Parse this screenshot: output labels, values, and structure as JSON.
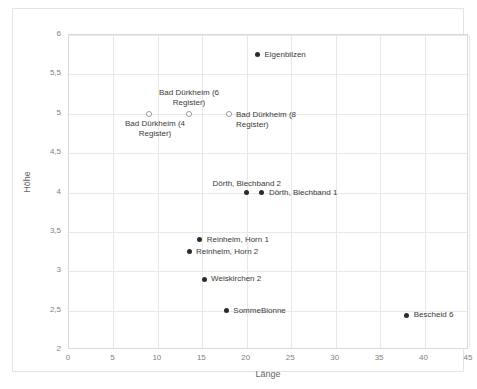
{
  "chart_data": {
    "type": "scatter",
    "title": "",
    "xlabel": "Länge",
    "ylabel": "Höhe",
    "xlim": [
      0,
      45
    ],
    "ylim": [
      2,
      6
    ],
    "grid": true,
    "legend": "none",
    "xticks": [
      "0",
      "5",
      "10",
      "15",
      "20",
      "25",
      "30",
      "35",
      "40",
      "45"
    ],
    "xtick_values": [
      0,
      5,
      10,
      15,
      20,
      25,
      30,
      35,
      40,
      45
    ],
    "yticks": [
      "2",
      "2,5",
      "3",
      "3,5",
      "4",
      "4,5",
      "5",
      "5,5",
      "6"
    ],
    "ytick_values": [
      2,
      2.5,
      3,
      3.5,
      4,
      4.5,
      5,
      5.5,
      6
    ],
    "points": [
      {
        "name": "Eigenbilzen",
        "x": 21.2,
        "y": 5.75,
        "marker": "filled",
        "label": "Eigenbilzen",
        "label_pos": "right",
        "label_dx": 7,
        "label_dy": -5
      },
      {
        "name": "Bad Dürkheim (4 Register)",
        "x": 9.0,
        "y": 5.0,
        "marker": "hollow",
        "label": "Bad Dürkheim (4\nRegister)",
        "label_pos": "center",
        "label_dx": 6,
        "label_dy": 5
      },
      {
        "name": "Bad Dürkheim (6 Register)",
        "x": 13.5,
        "y": 5.0,
        "marker": "hollow",
        "label": "Bad Dürkheim (6\nRegister)",
        "label_pos": "center",
        "label_dx": 0,
        "label_dy": -26
      },
      {
        "name": "Bad Dürkheim (8 Register)",
        "x": 18.0,
        "y": 5.0,
        "marker": "hollow",
        "label": "Bad Dürkheim (8\nRegister)",
        "label_pos": "right",
        "label_dx": 7,
        "label_dy": -4
      },
      {
        "name": "Dörth, Blechband 2",
        "x": 20.0,
        "y": 4.0,
        "marker": "filled",
        "label": "Dörth, Blechband 2",
        "label_pos": "center",
        "label_dx": 0,
        "label_dy": -14
      },
      {
        "name": "Dörth, Blechband 1",
        "x": 21.7,
        "y": 4.0,
        "marker": "filled",
        "label": "Dörth, Blechband 1",
        "label_pos": "right",
        "label_dx": 7,
        "label_dy": -5
      },
      {
        "name": "Reinheim, Horn 1",
        "x": 14.7,
        "y": 3.4,
        "marker": "filled",
        "label": "Reinheim, Horn 1",
        "label_pos": "right",
        "label_dx": 7,
        "label_dy": -5
      },
      {
        "name": "Reinheim, Horn 2",
        "x": 13.5,
        "y": 3.25,
        "marker": "filled",
        "label": "Reinheim, Horn 2",
        "label_pos": "right",
        "label_dx": 7,
        "label_dy": -5
      },
      {
        "name": "Weiskirchen 2",
        "x": 15.2,
        "y": 2.9,
        "marker": "filled",
        "label": "Weiskirchen 2",
        "label_pos": "right",
        "label_dx": 7,
        "label_dy": -5
      },
      {
        "name": "SommeBionne",
        "x": 17.7,
        "y": 2.5,
        "marker": "filled",
        "label": "SommeBionne",
        "label_pos": "right",
        "label_dx": 7,
        "label_dy": -5
      },
      {
        "name": "Bescheid 6",
        "x": 38.0,
        "y": 2.44,
        "marker": "filled",
        "label": "Bescheid 6",
        "label_pos": "right",
        "label_dx": 7,
        "label_dy": -5
      }
    ]
  },
  "colors": {
    "marker_filled": "#2b2b2b",
    "marker_hollow_stroke": "#9a9a9a",
    "gridline": "#e8e8e8",
    "axis_text": "#808080",
    "label_text": "#3a3a3a",
    "frame_border": "#e4e4e4"
  }
}
